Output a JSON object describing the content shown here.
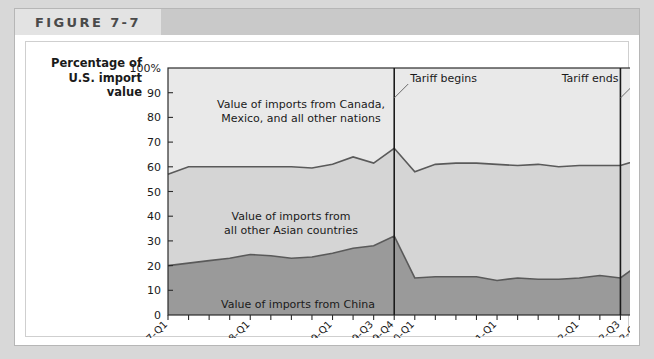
{
  "figure": {
    "label": "FIGURE 7-7"
  },
  "axis_title": {
    "line1": "Percentage of",
    "line2": "U.S. import",
    "line3": "value"
  },
  "colors": {
    "china_fill": "#9a9a9a",
    "asian_fill": "#d5d5d5",
    "other_fill": "#e9e9e9",
    "line": "#5a5a5a",
    "axis": "#2b2b2b",
    "header_band": "#c9c9c9",
    "header_box": "#e3e3e3",
    "page_bg": "#d8d8d8"
  },
  "chart_data": {
    "type": "area",
    "title": "",
    "subtitle": "",
    "xlabel": "",
    "ylabel": "Percentage of U.S. import value",
    "ylim": [
      0,
      100
    ],
    "ytick_values": [
      0,
      10,
      20,
      30,
      40,
      50,
      60,
      70,
      80,
      90,
      100
    ],
    "ytick_labels": [
      "0",
      "10",
      "20",
      "30",
      "40",
      "50",
      "60",
      "70",
      "80",
      "90",
      "100%"
    ],
    "grid": false,
    "legend_position": "inline-labels",
    "stacked": true,
    "x": [
      "2007-Q1",
      "2007-Q2",
      "2007-Q3",
      "2007-Q4",
      "2008-Q1",
      "2008-Q2",
      "2008-Q3",
      "2008-Q4",
      "2009-Q1",
      "2009-Q2",
      "2009-Q3",
      "2009-Q4",
      "2010-Q1",
      "2010-Q2",
      "2010-Q3",
      "2010-Q4",
      "2011-Q1",
      "2011-Q2",
      "2011-Q3",
      "2011-Q4",
      "2012-Q1",
      "2012-Q2",
      "2012-Q3",
      "2012-Q4"
    ],
    "xtick_labels_shown": [
      "2007-Q1",
      "2008-Q1",
      "2009-Q1",
      "2009-Q3",
      "2009-Q4",
      "2010-Q1",
      "2011-Q1",
      "2012-Q1",
      "2012-Q3",
      "2012-Q4"
    ],
    "series": [
      {
        "name": "Value of imports from China",
        "key": "china",
        "fill": "#9a9a9a",
        "values": [
          20,
          21,
          22,
          23,
          24.5,
          24,
          23,
          23.5,
          25,
          27,
          28,
          32,
          15,
          15.5,
          15.5,
          15.5,
          14,
          15,
          14.5,
          14.5,
          15,
          16,
          15,
          21
        ]
      },
      {
        "name": "Value of imports from all other Asian countries",
        "key": "other_asian",
        "fill": "#d5d5d5",
        "cumulative_top": [
          57,
          60,
          60,
          60,
          60,
          60,
          60,
          59.5,
          61,
          64,
          61.5,
          67.5,
          58,
          61,
          61.5,
          61.5,
          61,
          60.5,
          61,
          60,
          60.5,
          60.5,
          60.5,
          63
        ]
      },
      {
        "name": "Value of imports from Canada, Mexico, and all other nations",
        "key": "other_nations",
        "fill": "#e9e9e9",
        "cumulative_top": [
          100,
          100,
          100,
          100,
          100,
          100,
          100,
          100,
          100,
          100,
          100,
          100,
          100,
          100,
          100,
          100,
          100,
          100,
          100,
          100,
          100,
          100,
          100,
          100
        ]
      }
    ],
    "inline_labels": [
      {
        "id": "label-other-nations",
        "line1": "Value of imports from Canada,",
        "line2": "Mexico, and all other nations"
      },
      {
        "id": "label-other-asian",
        "line1": "Value of imports from",
        "line2": "all other Asian countries"
      },
      {
        "id": "label-china",
        "line1": "Value of imports from China",
        "line2": ""
      }
    ],
    "annotations": [
      {
        "id": "tariff-begins",
        "text": "Tariff begins",
        "x": "2009-Q4"
      },
      {
        "id": "tariff-ends",
        "text": "Tariff ends",
        "x": "2012-Q3"
      }
    ]
  }
}
